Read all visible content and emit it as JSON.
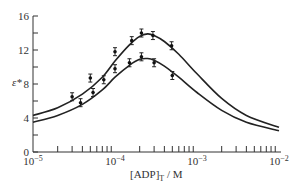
{
  "chart_data": {
    "type": "line",
    "title": "",
    "xlabel": "[ADP]T / M",
    "xlabel_main": "[ADP]",
    "xlabel_sub": "T",
    "xlabel_unit": " / M",
    "ylabel": "ε*",
    "xscale": "log",
    "xlim": [
      1e-05,
      0.01
    ],
    "ylim": [
      0,
      16
    ],
    "x_ticks": [
      "10−5",
      "10−4",
      "10−3",
      "10−2"
    ],
    "y_ticks": [
      "0",
      "4",
      "8",
      "12",
      "16"
    ],
    "grid": false,
    "legend": null,
    "series": [
      {
        "name": "upper curve",
        "fit_x": [
          1e-05,
          2e-05,
          4e-05,
          7e-05,
          0.0001,
          0.00015,
          0.0002,
          0.00025,
          0.0003,
          0.0004,
          0.0006,
          0.001,
          0.002,
          0.004,
          0.01
        ],
        "fit_y": [
          4.3,
          5.2,
          6.8,
          8.8,
          10.7,
          12.6,
          13.6,
          13.9,
          13.7,
          13.0,
          11.5,
          9.2,
          6.3,
          4.3,
          2.9
        ],
        "points_x": [
          3e-05,
          5e-05,
          0.0001,
          0.00016,
          0.00021,
          0.00029,
          0.00049
        ],
        "points_y": [
          6.5,
          8.7,
          11.8,
          13.1,
          14.0,
          13.7,
          12.5
        ]
      },
      {
        "name": "lower curve",
        "fit_x": [
          1e-05,
          2e-05,
          4e-05,
          7e-05,
          0.0001,
          0.00015,
          0.0002,
          0.00025,
          0.0003,
          0.0004,
          0.0006,
          0.001,
          0.002,
          0.004,
          0.01
        ],
        "fit_y": [
          3.5,
          4.3,
          5.6,
          7.3,
          8.8,
          10.2,
          10.9,
          11.0,
          10.8,
          10.1,
          8.8,
          7.0,
          4.9,
          3.5,
          2.5
        ],
        "points_x": [
          3.8e-05,
          5.4e-05,
          7.3e-05,
          0.0001,
          0.00015,
          0.00021,
          0.0003,
          0.0005
        ],
        "points_y": [
          5.8,
          7.0,
          8.5,
          9.8,
          10.5,
          11.2,
          10.5,
          9.0
        ]
      }
    ]
  }
}
